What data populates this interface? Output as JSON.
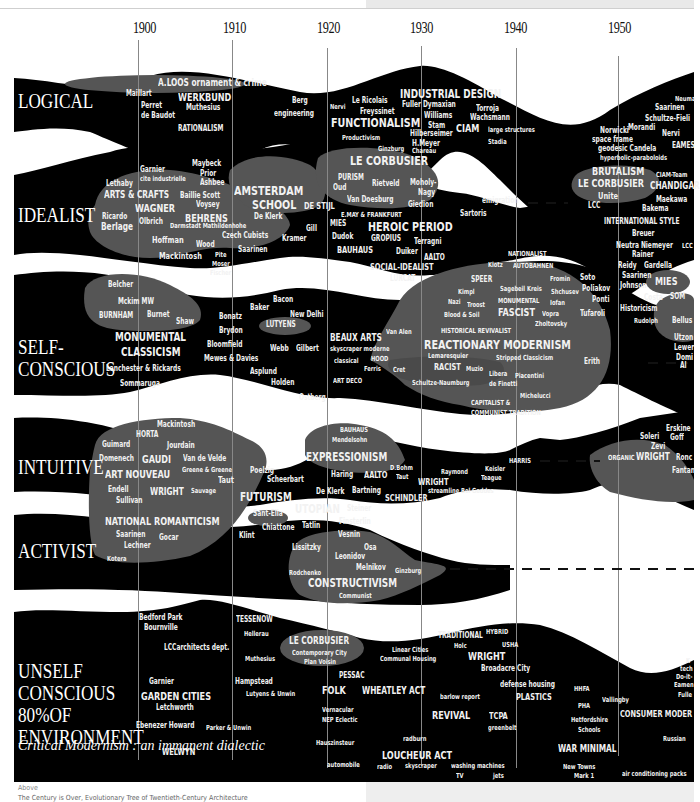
{
  "title": "Critical Modernism : an immanent dialectic",
  "caption": {
    "label": "Above",
    "text": "The Century is Over, Evolutionary Tree of Twentieth-Century Architecture"
  },
  "timeline": {
    "years": [
      "1900",
      "1910",
      "1920",
      "1930",
      "1940",
      "1950"
    ]
  },
  "categories": {
    "logical": "LOGICAL",
    "idealist": "IDEALIST",
    "self_conscious_1": "SELF-",
    "self_conscious_2": "CONSCIOUS",
    "intuitive": "INTUITIVE",
    "activist": "ACTIVIST",
    "unself_1": "UNSELF",
    "unself_2": "CONSCIOUS",
    "unself_3": "80%OF",
    "unself_4": "ENVIRONMENT"
  },
  "logical": {
    "aloos": "A.LOOS  ornament & crime",
    "maillart": "Maillart",
    "werkbund": "WERKBUND",
    "perret": "Perret",
    "debaudot": "de Baudot",
    "muthesius": "Muthesius",
    "rationalism": "RATIONALISM",
    "berg": "Berg",
    "engineering": "engineering",
    "nervi": "Nervi",
    "lericolais": "Le Ricolais",
    "freyssinet": "Freyssinet",
    "industrial_design": "INDUSTRIAL DESIGN",
    "fuller": "Fuller Dymaxian",
    "williams": "Williams",
    "torroja": "Torroja",
    "wachsmann": "Wachsmann",
    "functionalism": "FUNCTIONALISM",
    "stam": "Stam",
    "ciam": "CIAM",
    "large_structures": "large structures",
    "productivism": "Productivism",
    "hilberseimer": "Hilberseimer",
    "hmeyer": "H.Meyer",
    "stadia": "Stadia",
    "ginzburg": "Ginzburg",
    "chareau": "Chareau",
    "neumann": "Neuma",
    "saarinen": "Saarinen",
    "schultze_fielitz": "Schultze-Fieli",
    "norwicki": "Norwicki",
    "morandi": "Morandi",
    "nervi2": "Nervi",
    "space_frame": "space frame",
    "geodesic": "geodesic Candela",
    "eames": "EAMES",
    "hyperbolic": "hyperbolic-paraboloids"
  },
  "idealist": {
    "garnier": "Garnier",
    "cite": "cite industrielle",
    "maybeck": "Maybeck",
    "prior": "Prior",
    "ashbee": "Ashbee",
    "lethaby": "Lethaby",
    "arts_crafts": "ARTS & CRAFTS",
    "baillie": "Baillie Scott",
    "voysey": "Voysey",
    "wagner": "WAGNER",
    "ricardo": "Ricardo",
    "olbrich": "Olbrich",
    "behrens": "BEHRENS",
    "darmstadt": "Darmstadt Mathildenhohe",
    "berlage": "Berlage",
    "amsterdam": "AMSTERDAM",
    "school": "SCHOOL",
    "deklerk": "De Klerk",
    "destijl": "DE STIJL",
    "gill": "Gill",
    "hoffman": "Hoffman",
    "wood": "Wood",
    "czech": "Czech Cubists",
    "kramer": "Kramer",
    "mackintosh": "Mackintosh",
    "pite": "Pite",
    "saarinen": "Saarinen",
    "moser": "Moser",
    "fischer": "Fischer",
    "lecorbusier": "LE CORBUSIER",
    "purism": "PURISM",
    "oud": "Oud",
    "rietveld": "Rietveld",
    "moholy": "Moholy-",
    "nagy": "Nagy",
    "vandoesburg": "Van Doesburg",
    "giedion": "Giedion",
    "emigration": "emigration",
    "emay": "E.MAY & FRANKFURT",
    "sartoris": "Sartoris",
    "mies": "MIES",
    "heroic": "HEROIC PERIOD",
    "dudok": "Dudok",
    "gropius": "GROPIUS",
    "terragni": "Terragni",
    "bauhaus": "BAUHAUS",
    "duiker": "Duiker",
    "aalto": "AALTO",
    "social_idealist": "SOCIAL-IDEALIST",
    "lurcat": "LURCAT",
    "brutalism": "BRUTALISM",
    "lecorbusier2": "LE CORBUSIER",
    "unite": "Unite",
    "ciam_team": "CIAM-Team",
    "chandigarh": "CHANDIGAR",
    "lcc": "LCC",
    "maekawa": "Maekawa",
    "bakema": "Bakema",
    "international": "INTERNATIONAL STYLE",
    "breuer": "Breuer",
    "neutra": "Neutra Niemeyer",
    "lcc2": "LCC",
    "rainer": "Rainer",
    "reidy": "Reidy",
    "gardella": "Gardella",
    "saarinen2": "Saarinen"
  },
  "self_conscious": {
    "belcher": "Belcher",
    "mckim": "Mckim MW",
    "burnham": "BURNHAM",
    "burnet": "Burnet",
    "shaw": "Shaw",
    "monumental": "MONUMENTAL",
    "classicism": "CLASSICISM",
    "lanchester": "Lanchester & Rickards",
    "sommaruga": "Sommaruga",
    "bacon": "Bacon",
    "baker": "Baker",
    "newdelhi": "New Delhi",
    "bonatz": "Bonatz",
    "brydon": "Brydon",
    "lutyens": "LUTYENS",
    "bloomfield": "Bloomfield",
    "webb": "Webb",
    "gilbert": "Gilbert",
    "mewes": "Mewes & Davies",
    "asplund": "Asplund",
    "holden": "Holden",
    "ostberg": "Ostberg",
    "beauxarts": "BEAUX ARTS",
    "skyscraper": "skyscraper moderne",
    "classical": "classical",
    "hood": "HOOD",
    "ferris": "Ferris",
    "artdeco": "ART DECO",
    "vanalen": "Van Alen",
    "cret": "Cret",
    "nationalist": "NATIONALIST",
    "klotz": "Klotz",
    "autobahnen": "AUTOBAHNEN",
    "speer": "SPEER",
    "fomin": "Fromin",
    "soto": "Soto",
    "kimpl": "Kimpl",
    "sagebeil": "Sagebeil Kreis",
    "shchusev": "Shchusev",
    "poliakov": "Poliakov",
    "nazi": "Nazi",
    "troost": "Troost",
    "monumental2": "MONUMENTAL",
    "iofan": "Iofan",
    "ponti": "Ponti",
    "bloodsoil": "Blood & Soil",
    "fascist": "FASCIST",
    "vopra": "Vopra",
    "tufaroli": "Tufaroli",
    "zholtovsky": "Zholtovsky",
    "historical": "HISTORICAL REVIVALIST",
    "reactionary": "REACTIONARY MODERNISM",
    "lemaresquier": "Lemaresquier",
    "stripped": "Stripped Classicism",
    "racist": "RACIST",
    "muzio": "Muzio",
    "libera": "Libera",
    "piacentini": "Piacentini",
    "schultze": "Schultze-Naumburg",
    "definetti": "de Finetti",
    "michelucci": "Michelucci",
    "capitalist": "CAPITALIST &",
    "communist_tradition": "COMMUNIST TRADITION",
    "erith": "Erith",
    "johnson": "Johnson",
    "mies": "MIES",
    "costa": "Costa",
    "som": "SOM",
    "historicism": "Historicism",
    "rudolph": "Rudolph",
    "bellus": "Bellus",
    "utzon": "Utzon",
    "lewer": "Lewer",
    "domi": "Domi",
    "al": "Al"
  },
  "intuitive": {
    "mackintosh": "Mackintosh",
    "horta": "HORTA",
    "guimard": "Guimard",
    "jourdain": "Jourdain",
    "domenech": "Domenech",
    "gaudi": "GAUDI",
    "vandevelde": "Van de Velde",
    "greene": "Greene & Greene",
    "artnouveau": "ART NOUVEAU",
    "taut": "Taut",
    "endell": "Endell",
    "wright": "WRIGHT",
    "sauvage": "Sauvage",
    "sullivan": "Sullivan",
    "bauhaus": "BAUHAUS",
    "mendelsohn": "Mendelsohn",
    "expressionism": "EXPRESSIONISM",
    "poelzig": "Poelzig",
    "scheerbart": "Scheerbart",
    "haring": "Haring",
    "aalto": "AALTO",
    "dbohm": "D.Bohm",
    "taut2": "Taut",
    "deklerk": "De Klerk",
    "bartning": "Bartning",
    "schindler": "SCHINDLER",
    "wright2": "WRIGHT",
    "raymond": "Raymond",
    "keisler": "Keisler",
    "teague": "Teague",
    "streamline": "streamline Bel Geddes",
    "harris": "HARRIS",
    "erskine": "Erskine",
    "soleri": "Soleri",
    "goff": "Goff",
    "zevi": "Zevi",
    "organic": "ORGANIC",
    "wright3": "WRIGHT",
    "ronc": "Ronc",
    "fantan": "Fantan"
  },
  "activist": {
    "national": "NATIONAL ROMANTICISM",
    "saarinen": "Saarinen",
    "gocar": "Gocar",
    "lechner": "Lechner",
    "kotera": "Kotera",
    "futurism": "FUTURISM",
    "santelia": "Sant-Elia",
    "utopian": "UTOPIAN",
    "steiner": "Steiner",
    "chiattone": "Chiattone",
    "tatlin": "Tatlin",
    "finsterlin": "Finsterlin",
    "klint": "Klint",
    "vesnin": "Vesnin",
    "lissitzky": "Lissitzky",
    "osa": "Osa",
    "leonidov": "Leonidov",
    "melnikov": "Melnikov",
    "rodchenko": "Rodchenko",
    "ginzburg": "Ginzburg",
    "constructivism": "CONSTRUCTIVISM",
    "communist": "Communist"
  },
  "unself": {
    "bedford": "Bedford Park",
    "bournville": "Bournville",
    "lcc": "LCCarchitects dept.",
    "tessenow": "TESSENOW",
    "hellerau": "Hellerau",
    "muthesius": "Muthesius",
    "lecorbusier": "LE CORBUSIER",
    "contemporary": "Contemporary City",
    "voisin": "Plan Voisin",
    "garnier": "Garnier",
    "gardencities": "GARDEN CITIES",
    "letchworth": "Letchworth",
    "hampstead": "Hampstead",
    "lutyensunwin": "Lutyens & Unwin",
    "ebenezer": "Ebenezer Howard",
    "parker": "Parker & Unwin",
    "welwyn": "WELWYN",
    "pessac": "PESSAC",
    "folk": "FOLK",
    "vernacular": "Vernacular",
    "nep": "NEP Eclectic",
    "hauszinsteur": "Hauszinsteur",
    "automobile": "automobile",
    "linear": "Linear Cities",
    "communal": "Communal Housing",
    "wheatley": "WHEATLEY ACT",
    "radburn": "radburn",
    "loucheur": "LOUCHEUR ACT",
    "radio": "radio",
    "skyscraper": "skyscraper",
    "washing": "washing machines",
    "tv": "TV",
    "jets": "jets",
    "traditional": "TRADITIONAL",
    "hybrid": "HYBRID",
    "holc": "Holc",
    "usha": "USHA",
    "wright": "WRIGHT",
    "broadacre": "Broadacre City",
    "barlow": "barlow report",
    "defense": "defense housing",
    "plastics": "PLASTICS",
    "revival": "REVIVAL",
    "tcpa": "TCPA",
    "greenbelt": "greenbelt",
    "hhfa": "HHFA",
    "pha": "PHA",
    "vallingby": "Vallingby",
    "hertfordshire": "Hetfordshire",
    "schools": "Schools",
    "consumer": "CONSUMER MODER",
    "warminimal": "WAR MINIMAL",
    "russian": "Russian",
    "newtowns": "New Towns",
    "mark1": "Mark 1",
    "aircon": "air conditioning packs",
    "k": "K",
    "tech": "tech",
    "doit": "Do-it-",
    "eamen": "Eamen",
    "fulle": "Fulle"
  },
  "colors": {
    "band": "#000000",
    "cluster": "#555555",
    "text": "#f2f2f2",
    "background": "#ffffff",
    "gridline": "#888888"
  }
}
